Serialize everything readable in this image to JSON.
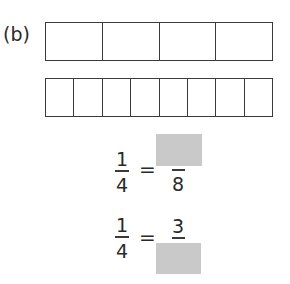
{
  "part_label": "(b)",
  "bars": [
    {
      "name": "fourths",
      "parts": 4
    },
    {
      "name": "eighths",
      "parts": 8
    }
  ],
  "equations": [
    {
      "left": {
        "numerator": "1",
        "denominator": "4"
      },
      "sign": "=",
      "right": {
        "numerator": "",
        "denominator": "8",
        "blank": "numerator"
      }
    },
    {
      "left": {
        "numerator": "1",
        "denominator": "4"
      },
      "sign": "=",
      "right": {
        "numerator": "3",
        "denominator": "",
        "blank": "denominator"
      }
    }
  ],
  "colors": {
    "blank_fill": "#c9c9c9",
    "lines": "#3a3a3a"
  }
}
